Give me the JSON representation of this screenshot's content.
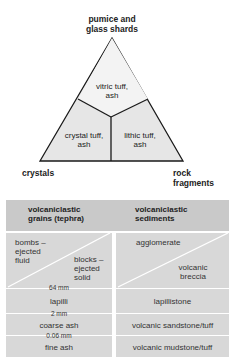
{
  "triangle": {
    "apex_label_line1": "pumice and",
    "apex_label_line2": "glass shards",
    "left_label": "crystals",
    "right_label_line1": "rock",
    "right_label_line2": "fragments",
    "fields": {
      "top_line1": "vitric tuff,",
      "top_line2": "ash",
      "left_line1": "crystal tuff,",
      "left_line2": "ash",
      "right_line1": "lithic tuff,",
      "right_line2": "ash"
    },
    "colors": {
      "fill": "#e6e6e6",
      "stroke": "#1a1a1a"
    }
  },
  "table": {
    "headers": {
      "grains_line1": "volcaniclastic",
      "grains_line2": "grains (tephra)",
      "sediments_line1": "volcaniclastic",
      "sediments_line2": "sediments"
    },
    "rows": {
      "coarse": {
        "bombs_line1": "bombs –",
        "bombs_line2": "ejected",
        "bombs_line3": "fluid",
        "blocks_line1": "blocks –",
        "blocks_line2": "ejected",
        "blocks_line3": "solid",
        "agglomerate": "agglomerate",
        "breccia_line1": "volcanic",
        "breccia_line2": "breccia"
      },
      "lapilli": {
        "grain": "lapilli",
        "sediment": "lapillistone"
      },
      "coarse_ash": {
        "grain": "coarse ash",
        "sediment": "volcanic sandstone/tuff"
      },
      "fine_ash": {
        "grain": "fine ash",
        "sediment": "volcanic mudstone/tuff"
      }
    },
    "size_limits": [
      "64 mm",
      "2 mm",
      "0.06 mm"
    ],
    "colors": {
      "header": "#c9c9c9",
      "body": "#d8d8d8",
      "divider": "#ffffff"
    }
  }
}
